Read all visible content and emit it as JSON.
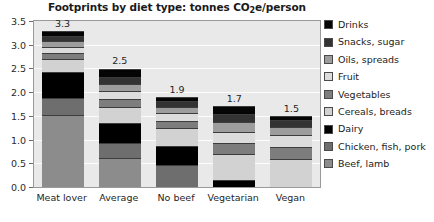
{
  "chart_data": {
    "type": "bar",
    "stacked": true,
    "title": "Footprints by diet type: tonnes CO2e/person",
    "title_prefix": "Footprints by diet type: tonnes CO",
    "title_sub": "2",
    "title_suffix": "e/person",
    "xlabel": "",
    "ylabel": "",
    "ylim": [
      0,
      3.5
    ],
    "ytick_labels": [
      "0.0",
      "0.5",
      "1.0",
      "1.5",
      "2.0",
      "2.5",
      "3.0",
      "3.5"
    ],
    "ytick_values": [
      0,
      0.5,
      1.0,
      1.5,
      2.0,
      2.5,
      3.0,
      3.5
    ],
    "grid": true,
    "legend_position": "right",
    "categories": [
      "Meat lover",
      "Average",
      "No beef",
      "Vegetarian",
      "Vegan"
    ],
    "totals": [
      3.3,
      2.5,
      1.9,
      1.7,
      1.5
    ],
    "total_labels": [
      "3.3",
      "2.5",
      "1.9",
      "1.7",
      "1.5"
    ],
    "series": [
      {
        "name": "Beef, lamb",
        "color": "#8c8c8c",
        "values": [
          1.52,
          0.62,
          0.0,
          0.0,
          0.0
        ]
      },
      {
        "name": "Chicken, fish, pork",
        "color": "#6e6e6e",
        "values": [
          0.36,
          0.3,
          0.46,
          0.0,
          0.0
        ]
      },
      {
        "name": "Dairy",
        "color": "#000000",
        "values": [
          0.55,
          0.44,
          0.4,
          0.14,
          0.0
        ]
      },
      {
        "name": "Cereals, breads",
        "color": "#d2d2d2",
        "values": [
          0.26,
          0.33,
          0.38,
          0.56,
          0.59
        ]
      },
      {
        "name": "Vegetables",
        "color": "#7d7d7d",
        "values": [
          0.13,
          0.16,
          0.16,
          0.23,
          0.26
        ]
      },
      {
        "name": "Fruit",
        "color": "#dcdcdc",
        "values": [
          0.14,
          0.17,
          0.16,
          0.24,
          0.25
        ]
      },
      {
        "name": "Oils, spreads",
        "color": "#9d9d9d",
        "values": [
          0.12,
          0.15,
          0.13,
          0.2,
          0.17
        ]
      },
      {
        "name": "Snacks, sugar",
        "color": "#333333",
        "values": [
          0.11,
          0.16,
          0.13,
          0.17,
          0.15
        ]
      },
      {
        "name": "Drinks",
        "color": "#050505",
        "values": [
          0.11,
          0.17,
          0.08,
          0.16,
          0.08
        ]
      }
    ],
    "legend_order": [
      "Drinks",
      "Snacks, sugar",
      "Oils, spreads",
      "Fruit",
      "Vegetables",
      "Cereals, breads",
      "Dairy",
      "Chicken, fish, pork",
      "Beef, lamb"
    ],
    "legend_colors": [
      "#050505",
      "#333333",
      "#9d9d9d",
      "#dcdcdc",
      "#7d7d7d",
      "#d2d2d2",
      "#000000",
      "#6e6e6e",
      "#8c8c8c"
    ],
    "plot_bg": "#e9e9e9",
    "gridline_color": "#fdfdfd"
  }
}
